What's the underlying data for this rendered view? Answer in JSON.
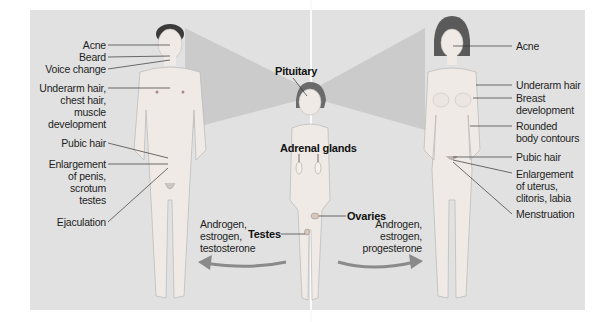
{
  "figure": {
    "colors": {
      "background": "#ffffff",
      "panel": "#e1e1e1",
      "shadow": "#c8c8c8",
      "skin": "#efeae6",
      "hair_male": "#3a3a3a",
      "hair_female": "#5a5a5a",
      "leader_line": "#333333",
      "arrow": "#8a8a8a"
    }
  },
  "male": {
    "labels": [
      {
        "text": "Acne"
      },
      {
        "text": "Beard"
      },
      {
        "text": "Voice change"
      },
      {
        "text": "Underarm hair,\nchest hair,\nmuscle\ndevelopment"
      },
      {
        "text": "Pubic hair"
      },
      {
        "text": "Enlargement\nof penis,\nscrotum\ntestes"
      },
      {
        "text": "Ejaculation"
      }
    ],
    "hormones": "Androgen,\nestrogen,\ntestosterone"
  },
  "child": {
    "labels": {
      "pituitary": "Pituitary",
      "adrenal": "Adrenal glands",
      "testes": "Testes",
      "ovaries": "Ovaries"
    }
  },
  "female": {
    "labels": [
      {
        "text": "Acne"
      },
      {
        "text": "Underarm hair"
      },
      {
        "text": "Breast\ndevelopment"
      },
      {
        "text": "Rounded\nbody contours"
      },
      {
        "text": "Pubic hair"
      },
      {
        "text": "Enlargement\nof uterus,\nclitoris, labia"
      },
      {
        "text": "Menstruation"
      }
    ],
    "hormones": "Androgen,\nestrogen,\nprogesterone"
  }
}
